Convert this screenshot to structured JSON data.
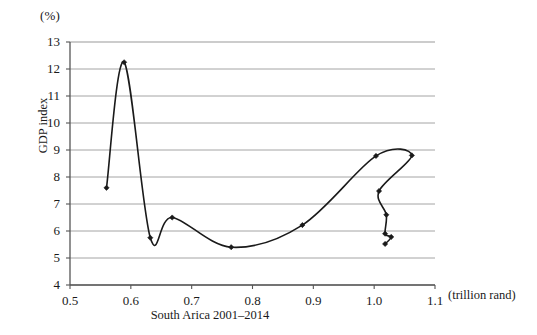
{
  "chart_data": {
    "type": "line",
    "title": "",
    "caption": "South Arica 2001–2014",
    "xlabel": "",
    "x_unit_label": "(trillion rand)",
    "ylabel": "GDP index",
    "y_unit_label": "(%)",
    "xlim": [
      0.5,
      1.1
    ],
    "ylim": [
      4,
      13
    ],
    "xticks": [
      "0.5",
      "0.6",
      "0.7",
      "0.8",
      "0.9",
      "1.0",
      "1.1"
    ],
    "xtick_values": [
      0.5,
      0.6,
      0.7,
      0.8,
      0.9,
      1.0,
      1.1
    ],
    "yticks": [
      "4",
      "5",
      "6",
      "7",
      "8",
      "9",
      "10",
      "11",
      "12",
      "13"
    ],
    "ytick_values": [
      4,
      5,
      6,
      7,
      8,
      9,
      10,
      11,
      12,
      13
    ],
    "grid": "horizontal",
    "legend": "none",
    "marker": "diamond",
    "line_color": "#1a1a1a",
    "grid_color": "#9a9a9a",
    "axis_color": "#555555",
    "series": [
      {
        "name": "South Arica 2001-2014",
        "points": [
          {
            "x": 0.56,
            "y": 7.6
          },
          {
            "x": 0.589,
            "y": 12.25
          },
          {
            "x": 0.632,
            "y": 5.75
          },
          {
            "x": 0.668,
            "y": 6.5
          },
          {
            "x": 0.765,
            "y": 5.4
          },
          {
            "x": 0.882,
            "y": 6.22
          },
          {
            "x": 1.003,
            "y": 8.78
          },
          {
            "x": 1.062,
            "y": 8.8
          },
          {
            "x": 1.008,
            "y": 7.48
          },
          {
            "x": 1.02,
            "y": 6.6
          },
          {
            "x": 1.018,
            "y": 5.9
          },
          {
            "x": 1.028,
            "y": 5.78
          },
          {
            "x": 1.018,
            "y": 5.52
          }
        ]
      }
    ]
  },
  "axis": {
    "y_unit": "(%)",
    "y_title": "GDP index",
    "x_unit": "(trillion rand)",
    "x_caption": "South Arica 2001–2014"
  }
}
